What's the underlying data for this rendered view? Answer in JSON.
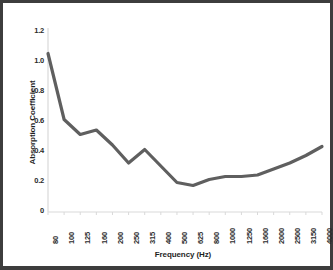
{
  "figure": {
    "background_color": "#ffffff",
    "frame_color": "#3d3d3d",
    "line_color": "#5f5f5f",
    "axis_color": "#d9d9d9",
    "text_color": "#1f1f1f"
  },
  "chart_data": {
    "type": "line",
    "title": "",
    "xlabel": "Frequency (Hz)",
    "ylabel": "Absorption Coefficient",
    "categories": [
      "80",
      "100",
      "125",
      "160",
      "200",
      "250",
      "315",
      "400",
      "500",
      "625",
      "800",
      "1000",
      "1250",
      "1600",
      "2000",
      "2500",
      "3150",
      "4000"
    ],
    "values": [
      1.05,
      0.61,
      0.51,
      0.54,
      0.44,
      0.32,
      0.41,
      0.3,
      0.19,
      0.17,
      0.21,
      0.23,
      0.23,
      0.24,
      0.28,
      0.32,
      0.37,
      0.43
    ],
    "yticks": [
      "0",
      "0.2",
      "0.4",
      "0.6",
      "0.8",
      "1.0",
      "1.2"
    ],
    "ytick_values": [
      0,
      0.2,
      0.4,
      0.6,
      0.8,
      1.0,
      1.2
    ],
    "ylim": [
      0,
      1.2
    ],
    "grid": false,
    "legend": false,
    "legend_position": "none",
    "series_name": "Absorption Coefficient"
  }
}
